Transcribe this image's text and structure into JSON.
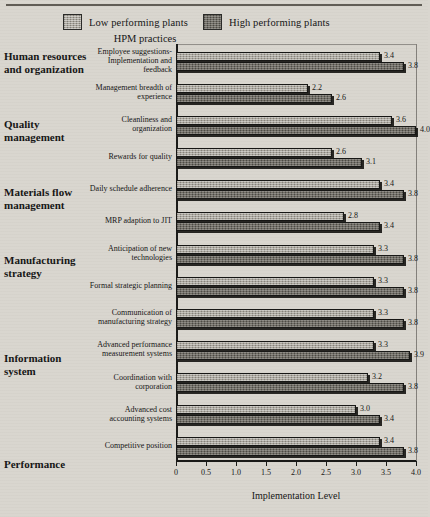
{
  "legend": {
    "low_label": "Low performing plants",
    "high_label": "High performing plants",
    "low_color": "#a9a59c",
    "high_color": "#6f6c64"
  },
  "hpm_header": "HPM practices",
  "groups": [
    {
      "label": "Human resources and organization",
      "top": 50
    },
    {
      "label": "Quality management",
      "top": 118
    },
    {
      "label": "Materials flow management",
      "top": 186
    },
    {
      "label": "Manufacturing strategy",
      "top": 254
    },
    {
      "label": "Information system",
      "top": 352
    },
    {
      "label": "Performance",
      "top": 458
    }
  ],
  "chart_data": {
    "type": "bar",
    "title": "",
    "xlabel": "Implementation Level",
    "ylabel": "HPM practices",
    "orientation": "horizontal",
    "xlim": [
      0,
      4.0
    ],
    "xticks": [
      "0",
      "0.5",
      "1.0",
      "1.5",
      "2.0",
      "2.5",
      "3.0",
      "3.5",
      "4.0"
    ],
    "xtick_values": [
      0,
      0.5,
      1.0,
      1.5,
      2.0,
      2.5,
      3.0,
      3.5,
      4.0
    ],
    "grid": false,
    "legend_position": "top",
    "categories": [
      "Employee suggestions-Implementation and feedback",
      "Management breadth of experience",
      "Cleanliness and organization",
      "Rewards for quality",
      "Daily schedule adherence",
      "MRP adaption to JIT",
      "Anticipation of new technologies",
      "Formal strategic planning",
      "Communication of manufacturing strategy",
      "Advanced performance measurement systems",
      "Coordination with corporation",
      "Advanced cost accounting systems",
      "Competitive position"
    ],
    "series": [
      {
        "name": "Low performing plants",
        "values": [
          3.4,
          2.2,
          3.6,
          2.6,
          3.4,
          2.8,
          3.3,
          3.3,
          3.3,
          3.3,
          3.2,
          3.0,
          3.4
        ],
        "labels": [
          "3.4",
          "2.2",
          "3.6",
          "2.6",
          "3.4",
          "2.8",
          "3.3",
          "3.3",
          "3.3",
          "3.3",
          "3.2",
          "3.0",
          "3.4"
        ]
      },
      {
        "name": "High performing plants",
        "values": [
          3.8,
          2.6,
          4.0,
          3.1,
          3.8,
          3.4,
          3.8,
          3.8,
          3.8,
          3.9,
          3.8,
          3.4,
          3.8
        ],
        "labels": [
          "3.8",
          "2.6",
          "4.0",
          "3.1",
          "3.8",
          "3.4",
          "3.8",
          "3.8",
          "3.8",
          "3.9",
          "3.8",
          "3.4",
          "3.8"
        ]
      }
    ]
  }
}
